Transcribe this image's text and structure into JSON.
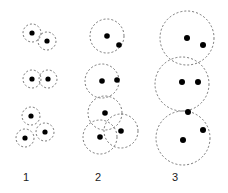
{
  "figure": {
    "title": "",
    "background_color": "#ffffff",
    "width": 228,
    "height": 193,
    "circle_stroke_color": "#555555",
    "circle_fill_color": "none",
    "circle_stroke_width": 0.8,
    "circle_dash_pattern": "2,2",
    "dot_color": "#000000",
    "label_color": "#1a1a1a"
  },
  "chart_data": {
    "type": "scatter",
    "title": "",
    "xlabel": "",
    "ylabel": "",
    "columns": [
      {
        "label": "1",
        "label_x": 26,
        "label_y": 181,
        "disk_radius": 9,
        "dot_radius": 2.6,
        "groups": [
          {
            "name": "top-group",
            "disks": [
              {
                "cx": 32,
                "cy": 33,
                "r": 9
              },
              {
                "cx": 47,
                "cy": 41,
                "r": 9
              }
            ],
            "dots": [
              {
                "cx": 32,
                "cy": 33
              },
              {
                "cx": 47,
                "cy": 41
              }
            ]
          },
          {
            "name": "middle-group",
            "disks": [
              {
                "cx": 32,
                "cy": 79,
                "r": 9
              },
              {
                "cx": 48,
                "cy": 79,
                "r": 9
              }
            ],
            "dots": [
              {
                "cx": 32,
                "cy": 79
              },
              {
                "cx": 48,
                "cy": 79
              }
            ]
          },
          {
            "name": "bottom-group",
            "disks": [
              {
                "cx": 31,
                "cy": 116,
                "r": 9
              },
              {
                "cx": 45,
                "cy": 132,
                "r": 9
              },
              {
                "cx": 25,
                "cy": 138,
                "r": 9
              }
            ],
            "dots": [
              {
                "cx": 31,
                "cy": 116
              },
              {
                "cx": 45,
                "cy": 132
              },
              {
                "cx": 25,
                "cy": 138
              }
            ]
          }
        ]
      },
      {
        "label": "2",
        "label_x": 98,
        "label_y": 181,
        "disk_radius": 17,
        "dot_radius": 2.8,
        "groups": [
          {
            "name": "top-group",
            "disks": [
              {
                "cx": 107,
                "cy": 36,
                "r": 17
              }
            ],
            "dots": [
              {
                "cx": 107,
                "cy": 36
              },
              {
                "cx": 119,
                "cy": 45
              }
            ]
          },
          {
            "name": "middle-group",
            "disks": [
              {
                "cx": 102,
                "cy": 81,
                "r": 17
              }
            ],
            "dots": [
              {
                "cx": 102,
                "cy": 81
              },
              {
                "cx": 117,
                "cy": 80
              }
            ]
          },
          {
            "name": "bottom-group",
            "disks": [
              {
                "cx": 105,
                "cy": 113,
                "r": 17
              },
              {
                "cx": 100,
                "cy": 137,
                "r": 17
              },
              {
                "cx": 121,
                "cy": 131,
                "r": 17
              }
            ],
            "dots": [
              {
                "cx": 105,
                "cy": 113
              },
              {
                "cx": 100,
                "cy": 137
              },
              {
                "cx": 121,
                "cy": 131
              }
            ]
          }
        ]
      },
      {
        "label": "3",
        "label_x": 175,
        "label_y": 181,
        "disk_radius": 27,
        "dot_radius": 3.0,
        "groups": [
          {
            "name": "top-group",
            "disks": [
              {
                "cx": 187,
                "cy": 38,
                "r": 27
              }
            ],
            "dots": [
              {
                "cx": 187,
                "cy": 38
              },
              {
                "cx": 203,
                "cy": 45
              }
            ]
          },
          {
            "name": "middle-group",
            "disks": [
              {
                "cx": 182,
                "cy": 84,
                "r": 27
              }
            ],
            "dots": [
              {
                "cx": 182,
                "cy": 82
              },
              {
                "cx": 198,
                "cy": 82
              }
            ]
          },
          {
            "name": "bottom-group",
            "disks": [
              {
                "cx": 183,
                "cy": 138,
                "r": 27
              }
            ],
            "dots": [
              {
                "cx": 183,
                "cy": 140
              },
              {
                "cx": 203,
                "cy": 130
              },
              {
                "cx": 188,
                "cy": 112
              }
            ]
          }
        ]
      }
    ]
  }
}
